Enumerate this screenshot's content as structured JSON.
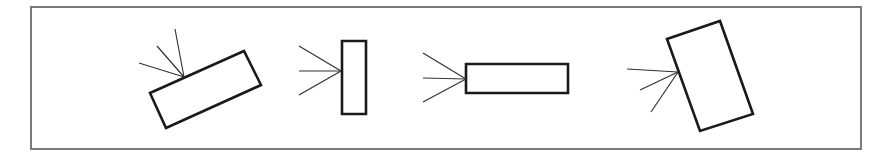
{
  "diagram": {
    "colors": {
      "background": "#ffffff",
      "frame": "#7a7a7a",
      "shape_stroke": "#1a1a1a",
      "ray_stroke": "#333333"
    },
    "frame": {
      "x": 31,
      "y": 7,
      "width": 830,
      "height": 142
    },
    "figures": [
      {
        "id": "tilted-rectangle",
        "rect_points": [
          [
            150,
            93
          ],
          [
            244,
            51
          ],
          [
            261,
            85
          ],
          [
            166,
            128
          ]
        ],
        "rays_target": [
          184,
          77
        ],
        "rays_from": [
          [
            175,
            29
          ],
          [
            157,
            46
          ],
          [
            139,
            63
          ]
        ]
      },
      {
        "id": "vertical-rectangle",
        "rect_points": [
          [
            342,
            41
          ],
          [
            366,
            41
          ],
          [
            366,
            114
          ],
          [
            342,
            114
          ]
        ],
        "rays_target": [
          341,
          71
        ],
        "rays_from": [
          [
            299,
            46
          ],
          [
            299,
            71
          ],
          [
            299,
            95
          ]
        ]
      },
      {
        "id": "horizontal-rectangle",
        "rect_points": [
          [
            466,
            64
          ],
          [
            568,
            64
          ],
          [
            568,
            93
          ],
          [
            466,
            93
          ]
        ],
        "rays_target": [
          466,
          79
        ],
        "rays_from": [
          [
            423,
            53
          ],
          [
            423,
            78
          ],
          [
            423,
            102
          ]
        ]
      },
      {
        "id": "steep-tilted-rectangle",
        "rect_points": [
          [
            667,
            39
          ],
          [
            720,
            21
          ],
          [
            753,
            114
          ],
          [
            700,
            131
          ]
        ],
        "rays_target": [
          678,
          72
        ],
        "rays_from": [
          [
            627,
            69
          ],
          [
            640,
            90
          ],
          [
            651,
            112
          ]
        ]
      }
    ]
  }
}
